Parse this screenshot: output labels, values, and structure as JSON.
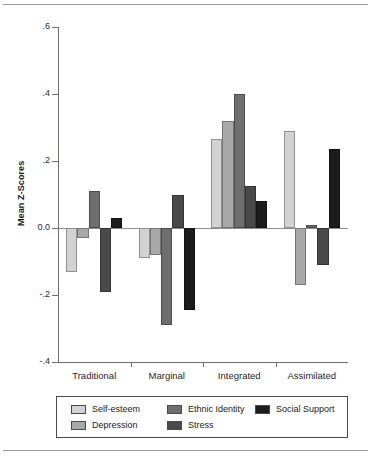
{
  "chart_data": {
    "type": "bar",
    "title": "",
    "subtitle": "",
    "xlabel": "",
    "ylabel": "Mean Z-Scores",
    "categories": [
      "Traditional",
      "Marginal",
      "Integrated",
      "Assimilated"
    ],
    "ylim": [
      -0.4,
      0.6
    ],
    "yticks": [
      0.6,
      0.4,
      0.2,
      0.0,
      -0.2,
      -0.4
    ],
    "ytick_labels": [
      ".6",
      ".4",
      ".2",
      "0.0",
      "-.2",
      "-.4"
    ],
    "grid": false,
    "legend_position": "bottom",
    "zero_line": true,
    "series": [
      {
        "name": "Self-esteem",
        "color": "#d2d2d2",
        "values": [
          -0.13,
          -0.09,
          0.265,
          0.29
        ]
      },
      {
        "name": "Depression",
        "color": "#a8a8a8",
        "values": [
          -0.03,
          -0.08,
          0.32,
          -0.17
        ]
      },
      {
        "name": "Ethnic Identity",
        "color": "#6e6e6e",
        "values": [
          0.11,
          -0.29,
          0.4,
          0.01
        ]
      },
      {
        "name": "Stress",
        "color": "#4a4a4a",
        "values": [
          -0.19,
          0.1,
          0.125,
          -0.11
        ]
      },
      {
        "name": "Social Support",
        "color": "#1c1c1c",
        "values": [
          0.03,
          -0.245,
          0.08,
          0.235
        ]
      }
    ]
  },
  "legend": {
    "entries": [
      {
        "label": "Self-esteem",
        "color": "#d2d2d2"
      },
      {
        "label": "Depression",
        "color": "#a8a8a8"
      },
      {
        "label": "Ethnic Identity",
        "color": "#6e6e6e"
      },
      {
        "label": "Stress",
        "color": "#4a4a4a"
      },
      {
        "label": "Social Support",
        "color": "#1c1c1c"
      }
    ]
  }
}
